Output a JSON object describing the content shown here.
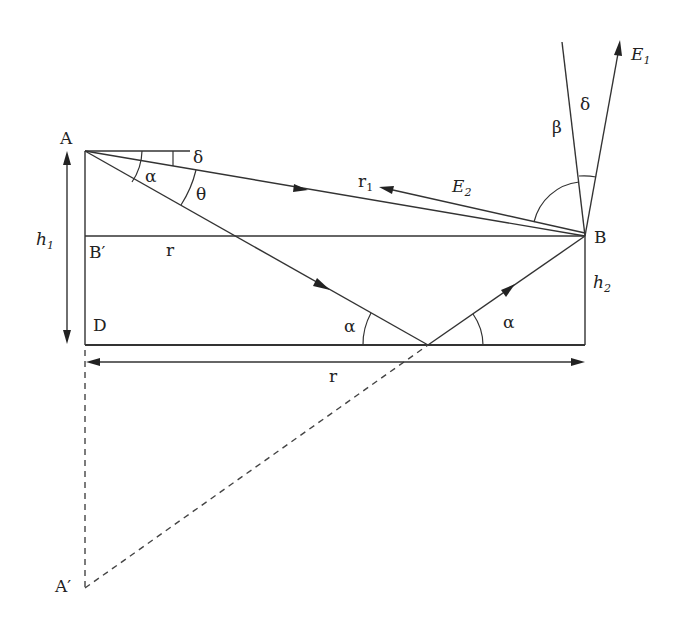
{
  "diagram": {
    "points": {
      "A": "A",
      "B": "B",
      "B_prime": "B′",
      "D": "D",
      "A_prime": "A′"
    },
    "lengths": {
      "h1_main": "h",
      "h1_sub": "1",
      "h2_main": "h",
      "h2_sub": "2",
      "r_upper": "r",
      "r_lower": "r",
      "r1_main": "r",
      "r1_sub": "1"
    },
    "angles": {
      "alpha_at_A": "α",
      "delta_at_A": "δ",
      "theta_at_A": "θ",
      "alpha_incident": "α",
      "alpha_reflected": "α",
      "beta_at_B": "β",
      "delta_at_B": "δ"
    },
    "fields": {
      "E1_main": "E",
      "E1_sub": "1",
      "E2_main": "E",
      "E2_sub": "2"
    },
    "colors": {
      "line": "#333333",
      "background": "#ffffff"
    }
  }
}
